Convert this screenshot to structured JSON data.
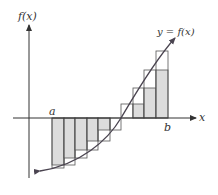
{
  "labels": {
    "y_axis": "f(x)",
    "x_axis": "x",
    "curve": "y = f(x)",
    "a": "a",
    "b": "b"
  },
  "colors": {
    "axis": "#333333",
    "curve": "#4a4450",
    "shade": "#dcdcdc",
    "outline": "#555555"
  },
  "chart_data": {
    "type": "diagram",
    "x_edges": [
      52,
      64,
      75,
      87,
      98,
      110,
      121,
      133,
      144,
      156,
      168
    ],
    "axis_y": 118,
    "rectangles": [
      {
        "x0": 52,
        "x1": 64,
        "shade_y": 165,
        "outer_y": 168
      },
      {
        "x0": 64,
        "x1": 75,
        "shade_y": 158,
        "outer_y": 165
      },
      {
        "x0": 75,
        "x1": 87,
        "shade_y": 150,
        "outer_y": 158
      },
      {
        "x0": 87,
        "x1": 98,
        "shade_y": 141,
        "outer_y": 150
      },
      {
        "x0": 98,
        "x1": 110,
        "shade_y": 130,
        "outer_y": 141
      },
      {
        "x0": 110,
        "x1": 121,
        "shade_y": 118,
        "outer_y": 130
      },
      {
        "x0": 121,
        "x1": 133,
        "shade_y": 118,
        "outer_y": 104
      },
      {
        "x0": 133,
        "x1": 144,
        "shade_y": 104,
        "outer_y": 88
      },
      {
        "x0": 144,
        "x1": 156,
        "shade_y": 88,
        "outer_y": 70
      },
      {
        "x0": 156,
        "x1": 168,
        "shade_y": 70,
        "outer_y": 51
      }
    ]
  }
}
